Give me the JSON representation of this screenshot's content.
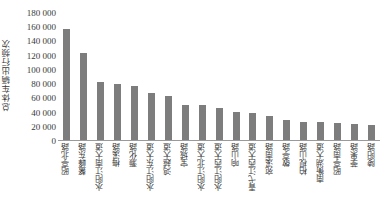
{
  "chart_data": {
    "type": "bar",
    "title": "",
    "xlabel": "",
    "ylabel": "总体车辆出行频次",
    "ylim": [
      0,
      180000
    ],
    "grid": false,
    "legend": null,
    "ytick_labels": [
      "180 000",
      "160 000",
      "140 000",
      "120 000",
      "100 000",
      "80 000",
      "60 000",
      "40 000",
      "20 000",
      "0"
    ],
    "ytick_values": [
      180000,
      160000,
      140000,
      120000,
      100000,
      80000,
      60000,
      40000,
      20000,
      0
    ],
    "bar_color": "#7d7d7d",
    "axis_color": "#9a9a9a",
    "text_color": "#3a3a3a",
    "categories": [
      "昭亭北路",
      "鳌峰东路",
      "水阳江南大道",
      "梅溪路",
      "灏化路",
      "水阳江东大道",
      "鸿越大道",
      "宝城路",
      "水阳江北大道",
      "水阳江西大道",
      "响山路",
      "青弋江西大道",
      "宛溪南路",
      "敬亭路",
      "柏枧山路",
      "南衡湖大道",
      "昭亭南路",
      "荸果路",
      "陵阳路"
    ],
    "values": [
      158000,
      123000,
      82000,
      79000,
      76000,
      67000,
      62000,
      49000,
      49000,
      45000,
      40000,
      38000,
      34000,
      29000,
      25000,
      25000,
      24000,
      22000,
      21000
    ]
  }
}
